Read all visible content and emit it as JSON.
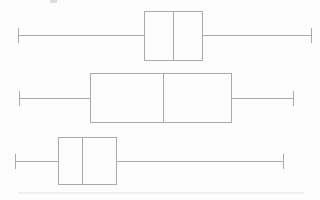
{
  "canvas": {
    "width": 320,
    "height": 200,
    "background": "#fdfdfd",
    "line_color": "#aaaaaa"
  },
  "chart_data": {
    "type": "boxplot",
    "orientation": "horizontal",
    "title": "",
    "xlabel": "",
    "ylabel": "",
    "axes_visible": false,
    "gridlines": false,
    "legend": false,
    "tick_labels": [],
    "value_units": "pixel coordinates (no numeric axis shown in image)",
    "series": [
      {
        "name": "boxplot-top",
        "whisker_min": 18,
        "q1": 144,
        "median": 173,
        "q3": 203,
        "whisker_max": 311,
        "center_y": 35,
        "box_top": 11,
        "box_bottom": 61,
        "cap_height": 15
      },
      {
        "name": "boxplot-middle",
        "whisker_min": 19,
        "q1": 90,
        "median": 163,
        "q3": 232,
        "whisker_max": 293,
        "center_y": 98,
        "box_top": 73,
        "box_bottom": 123,
        "cap_height": 15
      },
      {
        "name": "boxplot-bottom",
        "whisker_min": 15,
        "q1": 58,
        "median": 82,
        "q3": 117,
        "whisker_max": 283,
        "center_y": 161,
        "box_top": 137,
        "box_bottom": 185,
        "cap_height": 15
      }
    ]
  },
  "artifacts": {
    "top_speck": {
      "x": 50,
      "y": 0,
      "width": 7,
      "height": 3,
      "color": "#dcdcdc"
    },
    "bottom_faint_line": {
      "x": 18,
      "y": 192,
      "width": 286,
      "height": 2,
      "color": "#f0eeee"
    }
  }
}
